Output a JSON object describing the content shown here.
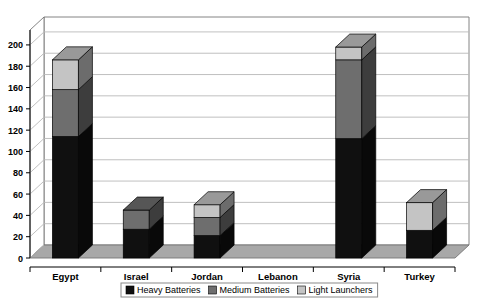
{
  "chart_data": {
    "type": "bar",
    "subtype": "stacked-column-3d",
    "title": "",
    "xlabel": "",
    "ylabel": "",
    "ylim": [
      0,
      200
    ],
    "ytick_step": 20,
    "yticks": [
      0,
      20,
      40,
      60,
      80,
      100,
      120,
      140,
      160,
      180,
      200
    ],
    "grid": true,
    "legend_position": "bottom-center",
    "categories": [
      "Egypt",
      "Israel",
      "Jordan",
      "Lebanon",
      "Syria",
      "Turkey"
    ],
    "series": [
      {
        "name": "Heavy Batteries",
        "color": "#101010",
        "values": [
          114,
          27,
          21,
          0,
          112,
          26
        ]
      },
      {
        "name": "Medium Batteries",
        "color": "#6e6e6e",
        "values": [
          44,
          18,
          17,
          0,
          74,
          0
        ]
      },
      {
        "name": "Light Launchers",
        "color": "#c4c4c4",
        "values": [
          28,
          0,
          12,
          0,
          12,
          26
        ]
      }
    ],
    "totals": [
      186,
      45,
      50,
      0,
      198,
      52
    ]
  },
  "axis": {
    "tick_labels": [
      "200",
      "180",
      "160",
      "140",
      "120",
      "100",
      "80",
      "60",
      "40",
      "20",
      "0"
    ]
  },
  "legend": {
    "items": [
      {
        "label": "Heavy Batteries",
        "swatch": "heavy-swatch"
      },
      {
        "label": "Medium Batteries",
        "swatch": "medium-swatch"
      },
      {
        "label": "Light Launchers",
        "swatch": "light-swatch"
      }
    ]
  },
  "colors": {
    "heavy": "#101010",
    "medium": "#6e6e6e",
    "light": "#c4c4c4",
    "floor": "#a8a8a8",
    "wall": "#ffffff",
    "gridline": "#b9b9b9",
    "border": "#767676",
    "side_shade": "#000000"
  }
}
